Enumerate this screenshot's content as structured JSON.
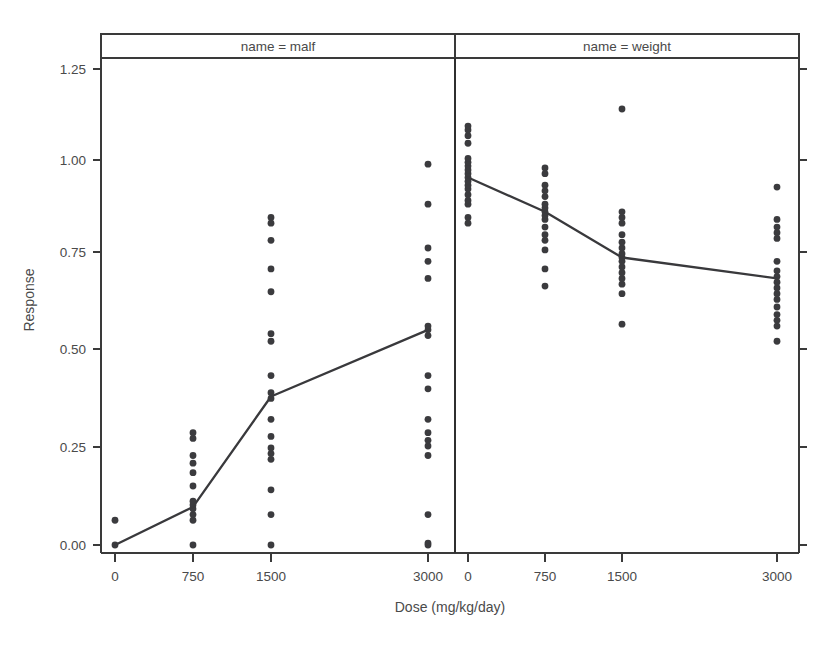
{
  "chart_data": {
    "type": "scatter",
    "title": "",
    "xlabel": "Dose (mg/kg/day)",
    "ylabel": "Response",
    "xlim": [
      -250,
      3250
    ],
    "ylim": [
      -0.06,
      1.29
    ],
    "grid": false,
    "legend_position": "none",
    "x_tick_labels": [
      "0",
      "750",
      "1500",
      "3000"
    ],
    "x_tick_values": [
      0,
      750,
      1500,
      3000
    ],
    "y_tick_labels": [
      "0.00",
      "0.25",
      "0.50",
      "0.75",
      "1.00",
      "1.25"
    ],
    "y_tick_values": [
      0.0,
      0.25,
      0.5,
      0.75,
      1.0,
      1.25
    ],
    "panel_variable": "name",
    "panels": [
      {
        "strip_label": "name = malf",
        "name": "malf",
        "categories": [
          0,
          750,
          1500,
          3000
        ],
        "mean_series": {
          "name": "mean response",
          "x": [
            0,
            750,
            1500,
            3000
          ],
          "values": [
            0.0,
            0.1,
            0.39,
            0.565
          ]
        },
        "points": [
          {
            "x": 0,
            "y": 0.0
          },
          {
            "x": 0,
            "y": 0.065
          },
          {
            "x": 750,
            "y": 0.0
          },
          {
            "x": 750,
            "y": 0.065
          },
          {
            "x": 750,
            "y": 0.08
          },
          {
            "x": 750,
            "y": 0.095
          },
          {
            "x": 750,
            "y": 0.105
          },
          {
            "x": 750,
            "y": 0.115
          },
          {
            "x": 750,
            "y": 0.155
          },
          {
            "x": 750,
            "y": 0.19
          },
          {
            "x": 750,
            "y": 0.215
          },
          {
            "x": 750,
            "y": 0.235
          },
          {
            "x": 750,
            "y": 0.28
          },
          {
            "x": 750,
            "y": 0.295
          },
          {
            "x": 1500,
            "y": 0.0
          },
          {
            "x": 1500,
            "y": 0.08
          },
          {
            "x": 1500,
            "y": 0.145
          },
          {
            "x": 1500,
            "y": 0.225
          },
          {
            "x": 1500,
            "y": 0.24
          },
          {
            "x": 1500,
            "y": 0.255
          },
          {
            "x": 1500,
            "y": 0.285
          },
          {
            "x": 1500,
            "y": 0.33
          },
          {
            "x": 1500,
            "y": 0.385
          },
          {
            "x": 1500,
            "y": 0.4
          },
          {
            "x": 1500,
            "y": 0.445
          },
          {
            "x": 1500,
            "y": 0.535
          },
          {
            "x": 1500,
            "y": 0.555
          },
          {
            "x": 1500,
            "y": 0.665
          },
          {
            "x": 1500,
            "y": 0.725
          },
          {
            "x": 1500,
            "y": 0.8
          },
          {
            "x": 1500,
            "y": 0.845
          },
          {
            "x": 1500,
            "y": 0.86
          },
          {
            "x": 3000,
            "y": 0.0
          },
          {
            "x": 3000,
            "y": 0.005
          },
          {
            "x": 3000,
            "y": 0.08
          },
          {
            "x": 3000,
            "y": 0.235
          },
          {
            "x": 3000,
            "y": 0.26
          },
          {
            "x": 3000,
            "y": 0.275
          },
          {
            "x": 3000,
            "y": 0.295
          },
          {
            "x": 3000,
            "y": 0.33
          },
          {
            "x": 3000,
            "y": 0.41
          },
          {
            "x": 3000,
            "y": 0.445
          },
          {
            "x": 3000,
            "y": 0.55
          },
          {
            "x": 3000,
            "y": 0.565
          },
          {
            "x": 3000,
            "y": 0.575
          },
          {
            "x": 3000,
            "y": 0.7
          },
          {
            "x": 3000,
            "y": 0.745
          },
          {
            "x": 3000,
            "y": 0.78
          },
          {
            "x": 3000,
            "y": 0.895
          },
          {
            "x": 3000,
            "y": 1.0
          }
        ]
      },
      {
        "strip_label": "name = weight",
        "name": "weight",
        "categories": [
          0,
          750,
          1500,
          3000
        ],
        "mean_series": {
          "name": "mean response",
          "x": [
            0,
            750,
            1500,
            3000
          ],
          "values": [
            0.965,
            0.875,
            0.755,
            0.7
          ]
        },
        "points": [
          {
            "x": 0,
            "y": 0.845
          },
          {
            "x": 0,
            "y": 0.86
          },
          {
            "x": 0,
            "y": 0.895
          },
          {
            "x": 0,
            "y": 0.905
          },
          {
            "x": 0,
            "y": 0.92
          },
          {
            "x": 0,
            "y": 0.935
          },
          {
            "x": 0,
            "y": 0.945
          },
          {
            "x": 0,
            "y": 0.955
          },
          {
            "x": 0,
            "y": 0.965
          },
          {
            "x": 0,
            "y": 0.975
          },
          {
            "x": 0,
            "y": 0.985
          },
          {
            "x": 0,
            "y": 0.995
          },
          {
            "x": 0,
            "y": 1.005
          },
          {
            "x": 0,
            "y": 1.015
          },
          {
            "x": 0,
            "y": 1.055
          },
          {
            "x": 0,
            "y": 1.075
          },
          {
            "x": 0,
            "y": 1.09
          },
          {
            "x": 0,
            "y": 1.1
          },
          {
            "x": 750,
            "y": 0.68
          },
          {
            "x": 750,
            "y": 0.725
          },
          {
            "x": 750,
            "y": 0.775
          },
          {
            "x": 750,
            "y": 0.8
          },
          {
            "x": 750,
            "y": 0.815
          },
          {
            "x": 750,
            "y": 0.835
          },
          {
            "x": 750,
            "y": 0.855
          },
          {
            "x": 750,
            "y": 0.865
          },
          {
            "x": 750,
            "y": 0.875
          },
          {
            "x": 750,
            "y": 0.885
          },
          {
            "x": 750,
            "y": 0.895
          },
          {
            "x": 750,
            "y": 0.915
          },
          {
            "x": 750,
            "y": 0.93
          },
          {
            "x": 750,
            "y": 0.945
          },
          {
            "x": 750,
            "y": 0.975
          },
          {
            "x": 750,
            "y": 0.99
          },
          {
            "x": 1500,
            "y": 0.58
          },
          {
            "x": 1500,
            "y": 0.66
          },
          {
            "x": 1500,
            "y": 0.685
          },
          {
            "x": 1500,
            "y": 0.7
          },
          {
            "x": 1500,
            "y": 0.715
          },
          {
            "x": 1500,
            "y": 0.73
          },
          {
            "x": 1500,
            "y": 0.745
          },
          {
            "x": 1500,
            "y": 0.755
          },
          {
            "x": 1500,
            "y": 0.765
          },
          {
            "x": 1500,
            "y": 0.78
          },
          {
            "x": 1500,
            "y": 0.795
          },
          {
            "x": 1500,
            "y": 0.815
          },
          {
            "x": 1500,
            "y": 0.845
          },
          {
            "x": 1500,
            "y": 0.86
          },
          {
            "x": 1500,
            "y": 0.875
          },
          {
            "x": 1500,
            "y": 1.145
          },
          {
            "x": 3000,
            "y": 0.535
          },
          {
            "x": 3000,
            "y": 0.575
          },
          {
            "x": 3000,
            "y": 0.59
          },
          {
            "x": 3000,
            "y": 0.605
          },
          {
            "x": 3000,
            "y": 0.625
          },
          {
            "x": 3000,
            "y": 0.645
          },
          {
            "x": 3000,
            "y": 0.66
          },
          {
            "x": 3000,
            "y": 0.675
          },
          {
            "x": 3000,
            "y": 0.69
          },
          {
            "x": 3000,
            "y": 0.705
          },
          {
            "x": 3000,
            "y": 0.72
          },
          {
            "x": 3000,
            "y": 0.745
          },
          {
            "x": 3000,
            "y": 0.805
          },
          {
            "x": 3000,
            "y": 0.82
          },
          {
            "x": 3000,
            "y": 0.835
          },
          {
            "x": 3000,
            "y": 0.855
          },
          {
            "x": 3000,
            "y": 0.94
          }
        ]
      }
    ],
    "colors": {
      "point": "#3b3b3e",
      "line": "#39393c",
      "frame": "#3a3a3a",
      "text": "#4a4a4a",
      "background": "#ffffff"
    }
  }
}
